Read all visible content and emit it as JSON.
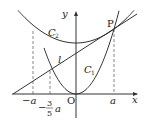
{
  "labels": {
    "y_axis": "y",
    "x_axis": "x",
    "origin": "O",
    "point_p": "P",
    "curve_c1": "C",
    "curve_c1_sub": "1",
    "curve_c2": "C",
    "curve_c2_sub": "2",
    "line_l": "l",
    "tick_a": "a",
    "tick_neg_a": "−a",
    "tick_frac_sign": "−",
    "tick_frac_num": "3",
    "tick_frac_den": "5",
    "tick_frac_var": "a"
  },
  "colors": {
    "stroke": "#333333"
  }
}
